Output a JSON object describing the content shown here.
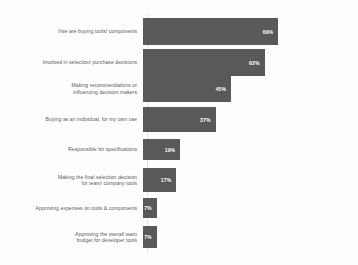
{
  "chart_data": {
    "type": "bar",
    "orientation": "horizontal",
    "title": "",
    "subtitle": "",
    "xlabel": "",
    "ylabel": "",
    "xlim": [
      0,
      100
    ],
    "grid": false,
    "legend": null,
    "value_suffix": "%",
    "bar_color": "#595959",
    "value_label_color": "#ffffff",
    "category_label_color": "#5a5a5a",
    "background_color": "#fdfdfd",
    "axis_line_color": "#e3e3e3",
    "categories": [
      "I/we are buying tools/ components",
      "Involved in selection/ purchase decisions",
      "Making recommendations or\ninfluencing decision makers",
      "Buying as an individual, for my own use",
      "Responsible for specifications",
      "Making the final selection decision\nfor team/ company tools",
      "Approving expenses on tools & components",
      "Approving the overall team\nbudget for developer tools"
    ],
    "values": [
      69,
      62,
      45,
      37,
      19,
      17,
      7,
      7
    ],
    "value_labels": [
      "69%",
      "62%",
      "45%",
      "37%",
      "19%",
      "17%",
      "7%",
      "7%"
    ]
  },
  "layout": {
    "plot_left_px": 148,
    "plot_width_px": 196,
    "rows": [
      {
        "top": 18,
        "height": 27
      },
      {
        "top": 49,
        "height": 27
      },
      {
        "top": 75,
        "height": 27
      },
      {
        "top": 107,
        "height": 25
      },
      {
        "top": 139,
        "height": 21
      },
      {
        "top": 168,
        "height": 24
      },
      {
        "top": 198,
        "height": 20
      },
      {
        "top": 226,
        "height": 22
      }
    ]
  }
}
